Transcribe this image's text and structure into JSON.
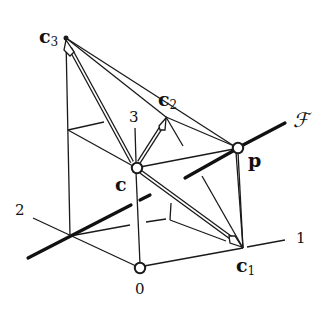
{
  "diagram": {
    "labels": {
      "c3": {
        "base": "c",
        "sub": "3"
      },
      "c2": {
        "base": "c",
        "sub": "2"
      },
      "c": {
        "base": "c"
      },
      "c1": {
        "base": "c",
        "sub": "1"
      },
      "p": {
        "base": "p"
      },
      "F": "ℱ",
      "axis1": "1",
      "axis2": "2",
      "axis3": "3",
      "origin": "0"
    },
    "colors": {
      "stroke": "#1a1a1a",
      "background": "#ffffff"
    }
  }
}
